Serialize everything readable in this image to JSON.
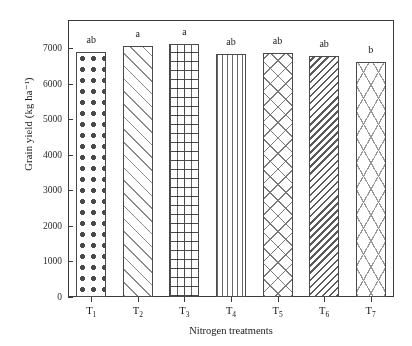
{
  "chart_data": {
    "type": "bar",
    "title": "",
    "xlabel": "Nitrogen treatments",
    "ylabel": "Grain yield (kg ha⁻¹)",
    "categories": [
      "T₁",
      "T₂",
      "T₃",
      "T₄",
      "T₅",
      "T₆",
      "T₇"
    ],
    "category_base": [
      "T",
      "T",
      "T",
      "T",
      "T",
      "T",
      "T"
    ],
    "category_sub": [
      "1",
      "2",
      "3",
      "4",
      "5",
      "6",
      "7"
    ],
    "values": [
      6900,
      7070,
      7120,
      6830,
      6880,
      6800,
      6610
    ],
    "annotations": [
      "ab",
      "a",
      "a",
      "ab",
      "ab",
      "ab",
      "b"
    ],
    "ylim": [
      0,
      7800
    ],
    "yticks": [
      0,
      1000,
      2000,
      3000,
      4000,
      5000,
      6000,
      7000
    ],
    "ytick_labels": [
      "0",
      "1000",
      "2000",
      "3000",
      "4000",
      "5000",
      "6000",
      "7000"
    ],
    "grid": false,
    "legend": "none",
    "bar_patterns": [
      "dots",
      "diagonal-forward",
      "brick",
      "vertical-lines",
      "diamond-grid",
      "diagonal-back-dense",
      "herringbone"
    ],
    "colors": {
      "axis": "#3a3a3a",
      "bar_edge": "#4a4a4a",
      "bar_fill": "#ffffff",
      "pattern_dark": "#4a4a4a",
      "pattern_light": "#8a8a8a",
      "text": "#1a1a1a",
      "background": "#ffffff"
    }
  }
}
